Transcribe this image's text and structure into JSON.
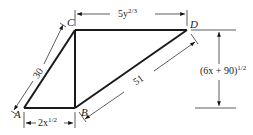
{
  "diagram": {
    "type": "quadrilateral-dimension-drawing",
    "vertices": {
      "A": {
        "label": "A"
      },
      "B": {
        "label": "B"
      },
      "C": {
        "label": "C"
      },
      "D": {
        "label": "D"
      }
    },
    "dimensions": {
      "AC": {
        "base": "30",
        "exp": ""
      },
      "BD": {
        "base": "51",
        "exp": ""
      },
      "AB": {
        "base": "2x",
        "exp": "1/2"
      },
      "CD": {
        "base": "5y",
        "exp": "2/3"
      },
      "height": {
        "base": "(6x + 90)",
        "exp": "1/2"
      }
    },
    "colors": {
      "stroke": "#1a1a1a",
      "dimension_line": "#333333"
    }
  }
}
